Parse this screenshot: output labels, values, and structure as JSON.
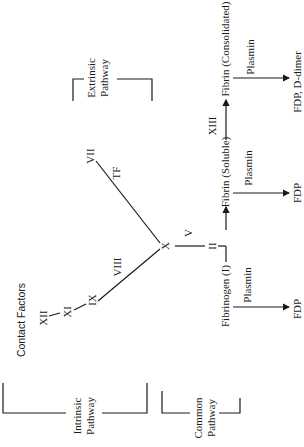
{
  "diagram": {
    "brackets": {
      "extrinsic": {
        "line1": "Extrinsic",
        "line2": "Pathway"
      },
      "intrinsic": {
        "line1": "Intrinsic",
        "line2": "Pathway"
      },
      "common": {
        "line1": "Common",
        "line2": "Pathway"
      }
    },
    "contact_factors": "Contact Factors",
    "factors": {
      "xii": "XII",
      "xi": "XI",
      "ix": "IX",
      "viii": "VIII",
      "vii": "VII",
      "tf": "TF",
      "x": "X",
      "v": "V",
      "ii": "II",
      "xiii": "XIII"
    },
    "nodes": {
      "fibrinogen": "Fibrinogen (I)",
      "fibrin_soluble": "Fibrin (Soluble)",
      "fibrin_consolidated": "Fibrin (Consolidated)"
    },
    "degradation": [
      {
        "enzyme": "Plasmin",
        "product": "FDP"
      },
      {
        "enzyme": "Plasmin",
        "product": "FDP"
      },
      {
        "enzyme": "Plasmin",
        "product": "FDP, D-dimer"
      }
    ],
    "colors": {
      "line": "#1a1a1a",
      "background": "#ffffff"
    }
  }
}
